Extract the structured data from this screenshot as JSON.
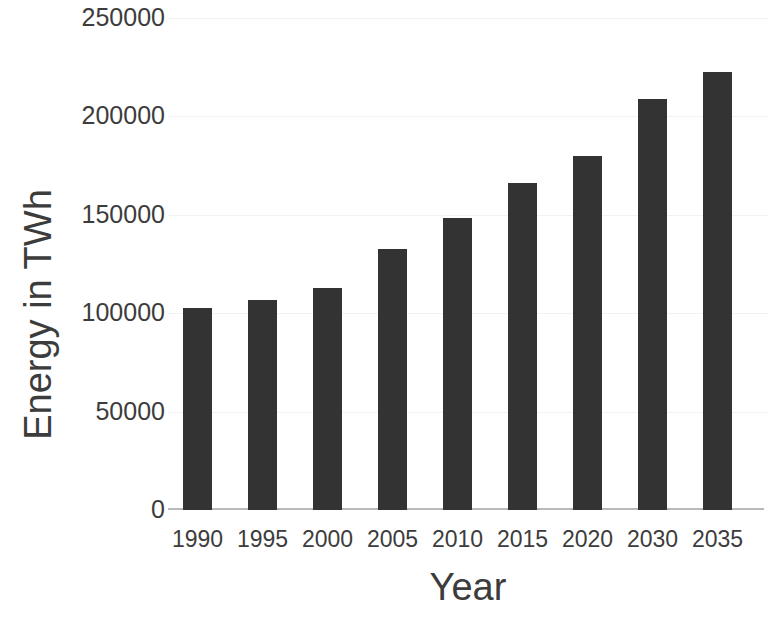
{
  "chart_data": {
    "type": "bar",
    "title": "",
    "xlabel": "Year",
    "ylabel": "Energy in TWh",
    "categories": [
      "1990",
      "1995",
      "2000",
      "2005",
      "2010",
      "2015",
      "2020",
      "2030",
      "2035"
    ],
    "values": [
      102500,
      106500,
      113000,
      132500,
      148500,
      166000,
      180000,
      209000,
      222500
    ],
    "series": [
      {
        "name": "Energy",
        "values": [
          102500,
          106500,
          113000,
          132500,
          148500,
          166000,
          180000,
          209000,
          222500
        ]
      }
    ],
    "ylim": [
      0,
      250000
    ],
    "y_ticks": [
      0,
      50000,
      100000,
      150000,
      200000,
      250000
    ],
    "y_tick_labels": [
      "0",
      "50000",
      "100000",
      "150000",
      "200000",
      "250000"
    ],
    "grid": true,
    "grid_axis": "y",
    "legend": false,
    "legend_position": "none",
    "bar_color": "#333333",
    "axis_color": "#b9b9b9",
    "grid_color": "#f2f2f2",
    "background_color": "#ffffff"
  },
  "axis": {
    "y_title": "Energy in TWh",
    "x_title": "Year"
  }
}
